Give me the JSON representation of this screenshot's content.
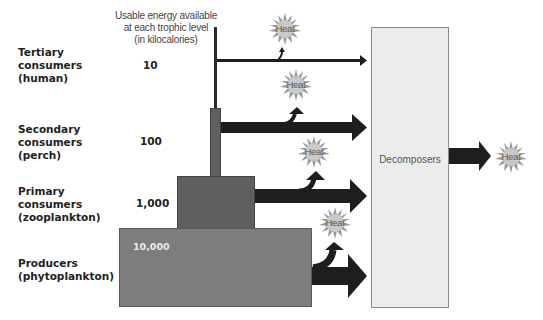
{
  "header": {
    "text": "Usable energy available\nat each trophic level\n(in kilocalories)"
  },
  "levels": [
    {
      "label": "Tertiary\nconsumers\n(human)",
      "value": "10"
    },
    {
      "label": "Secondary\nconsumers\n(perch)",
      "value": "100"
    },
    {
      "label": "Primary\nconsumers\n(zooplankton)",
      "value": "1,000"
    },
    {
      "label": "Producers\n(phytoplankton)",
      "value": "10,000"
    }
  ],
  "decomposers": {
    "label": "Decomposers"
  },
  "heat_label": "Heat",
  "colors": {
    "producer_block": "#7d7d7d",
    "consumer_block": "#5f5f5f",
    "arrow": "#1e1e1e",
    "decomposer_box": "#ececec",
    "heat_burst": "#9a9a9a"
  }
}
